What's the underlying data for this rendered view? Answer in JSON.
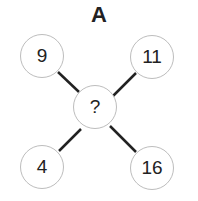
{
  "title": "A",
  "nodes": {
    "top_left": "9",
    "top_right": "11",
    "center": "?",
    "bottom_left": "4",
    "bottom_right": "16"
  },
  "colors": {
    "line": "#222222",
    "circle_border": "#bdbdbd",
    "text": "#222222"
  }
}
